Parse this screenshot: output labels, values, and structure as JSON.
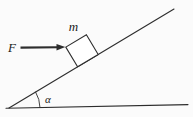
{
  "diagram": {
    "kind": "inclined-plane-force-diagram",
    "labels": {
      "force": "F",
      "mass": "m",
      "angle": "α"
    },
    "colors": {
      "line": "#2d2d2d",
      "text": "#1a1a1a",
      "background": "#fbfbfb"
    }
  }
}
